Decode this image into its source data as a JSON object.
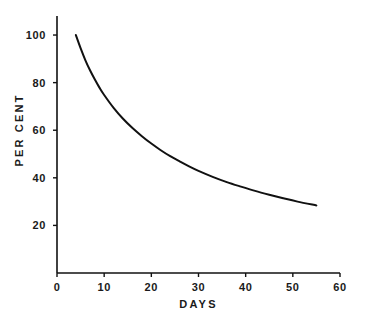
{
  "chart_data": {
    "type": "line",
    "title": "",
    "xlabel": "DAYS",
    "ylabel": "PER CENT",
    "xlim": [
      0,
      60
    ],
    "ylim": [
      0,
      108
    ],
    "xticks": [
      0,
      10,
      20,
      30,
      40,
      50,
      60
    ],
    "xtick_labels": [
      "0",
      "10",
      "20",
      "30",
      "40",
      "50",
      "60"
    ],
    "yticks": [
      20,
      40,
      60,
      80,
      100
    ],
    "ytick_labels": [
      "20",
      "40",
      "60",
      "80",
      "100"
    ],
    "grid": false,
    "legend": null,
    "line_color": "#111111",
    "line_width": 2.0,
    "series": [
      {
        "name": "per cent remaining",
        "x": [
          4,
          5,
          6,
          7,
          8,
          9,
          10,
          12,
          14,
          16,
          18,
          20,
          22,
          24,
          26,
          28,
          30,
          33,
          36,
          39,
          42,
          45,
          48,
          51,
          55
        ],
        "y": [
          100,
          94.5,
          89.5,
          85.2,
          81.4,
          77.9,
          74.8,
          69.4,
          64.8,
          60.9,
          57.5,
          54.4,
          51.6,
          49.1,
          46.9,
          44.8,
          42.9,
          40.4,
          38.2,
          36.3,
          34.5,
          32.9,
          31.4,
          30.0,
          28.4
        ]
      }
    ],
    "annotations": []
  },
  "axes": {
    "x_axis_name": "days-axis",
    "y_axis_name": "per-cent-axis"
  }
}
